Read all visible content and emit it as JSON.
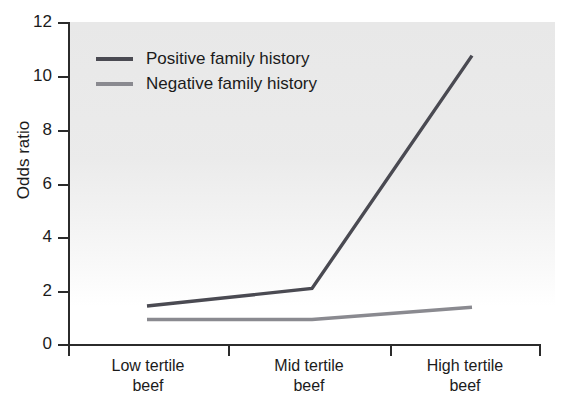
{
  "chart_data": {
    "type": "line",
    "title": "",
    "xlabel": "",
    "ylabel": "Odds ratio",
    "categories": [
      "Low tertile beef",
      "Mid tertile beef",
      "High tertile beef"
    ],
    "category_lines": [
      [
        "Low tertile",
        "beef"
      ],
      [
        "Mid tertile",
        "beef"
      ],
      [
        "High tertile",
        "beef"
      ]
    ],
    "ylim": [
      0,
      12
    ],
    "yticks": [
      0,
      2,
      4,
      6,
      8,
      10,
      12
    ],
    "ytick_labels": [
      "0",
      "2",
      "4",
      "6",
      "8",
      "10",
      "12"
    ],
    "grid": false,
    "legend_position": "upper-left-inside",
    "series": [
      {
        "name": "Positive family history",
        "values": [
          1.45,
          2.1,
          10.75
        ],
        "color": "#4a4a52"
      },
      {
        "name": "Negative family history",
        "values": [
          0.95,
          0.95,
          1.4
        ],
        "color": "#8a8a90"
      }
    ]
  },
  "legend": {
    "items": [
      {
        "label": "Positive family history",
        "color": "#4a4a52"
      },
      {
        "label": "Negative family history",
        "color": "#8a8a90"
      }
    ]
  },
  "axis": {
    "y_title": "Odds ratio",
    "y_labels": [
      "12",
      "10",
      "8",
      "6",
      "4",
      "2",
      "0"
    ]
  },
  "colors": {
    "panel_background": "#e8e8e8",
    "axis": "#2b2b2b",
    "text": "#1b1b1b",
    "series_positive": "#4a4a52",
    "series_negative": "#8a8a90"
  }
}
